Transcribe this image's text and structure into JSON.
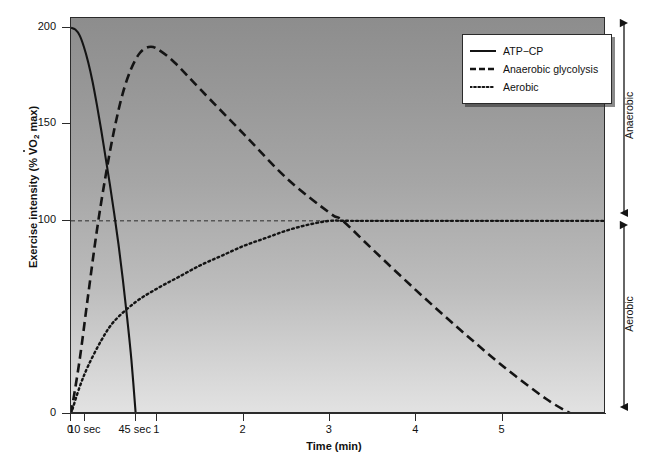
{
  "chart_data": {
    "type": "line",
    "title": "",
    "xlabel": "Time (min)",
    "ylabel": "Exercise intensity (% VO2 max)",
    "xlim": [
      0,
      6.2
    ],
    "ylim": [
      0,
      205
    ],
    "grid": false,
    "reference_line": {
      "y": 100,
      "style": "dashed",
      "label": ""
    },
    "xticks": [
      {
        "value": 0,
        "label": "0"
      },
      {
        "value": 0.1667,
        "label": "10 sec"
      },
      {
        "value": 0.75,
        "label": "45 sec"
      },
      {
        "value": 1,
        "label": "1"
      },
      {
        "value": 2,
        "label": "2"
      },
      {
        "value": 3,
        "label": "3"
      },
      {
        "value": 4,
        "label": "4"
      },
      {
        "value": 5,
        "label": "5"
      }
    ],
    "yticks": [
      {
        "value": 0,
        "label": "0"
      },
      {
        "value": 100,
        "label": "100"
      },
      {
        "value": 150,
        "label": "150"
      },
      {
        "value": 200,
        "label": "200"
      }
    ],
    "legend_position": "top-right",
    "series": [
      {
        "name": "ATP−CP",
        "style": "solid",
        "color": "#141414",
        "points": [
          [
            0.0,
            200
          ],
          [
            0.05,
            199
          ],
          [
            0.1,
            196
          ],
          [
            0.15,
            190
          ],
          [
            0.2,
            182
          ],
          [
            0.25,
            172
          ],
          [
            0.3,
            160
          ],
          [
            0.35,
            147
          ],
          [
            0.4,
            133
          ],
          [
            0.45,
            119
          ],
          [
            0.5,
            104
          ],
          [
            0.55,
            88
          ],
          [
            0.6,
            70
          ],
          [
            0.65,
            50
          ],
          [
            0.7,
            28
          ],
          [
            0.75,
            0
          ]
        ]
      },
      {
        "name": "Anaerobic glycolysis",
        "style": "dashed",
        "color": "#141414",
        "points": [
          [
            0.0,
            0
          ],
          [
            0.1,
            28
          ],
          [
            0.2,
            62
          ],
          [
            0.3,
            95
          ],
          [
            0.4,
            123
          ],
          [
            0.5,
            147
          ],
          [
            0.6,
            166
          ],
          [
            0.7,
            179
          ],
          [
            0.8,
            187
          ],
          [
            0.9,
            190
          ],
          [
            1.0,
            189
          ],
          [
            1.2,
            182
          ],
          [
            1.5,
            168
          ],
          [
            2.0,
            145
          ],
          [
            2.5,
            122
          ],
          [
            3.0,
            104
          ],
          [
            3.15,
            100
          ],
          [
            3.5,
            85
          ],
          [
            4.0,
            64
          ],
          [
            4.5,
            44
          ],
          [
            5.0,
            25
          ],
          [
            5.5,
            8
          ],
          [
            5.8,
            0
          ]
        ]
      },
      {
        "name": "Aerobic",
        "style": "dotted",
        "color": "#141414",
        "points": [
          [
            0.0,
            0
          ],
          [
            0.1,
            14
          ],
          [
            0.2,
            25
          ],
          [
            0.35,
            38
          ],
          [
            0.5,
            48
          ],
          [
            0.75,
            58
          ],
          [
            1.0,
            65
          ],
          [
            1.25,
            71
          ],
          [
            1.5,
            77
          ],
          [
            1.75,
            82
          ],
          [
            2.0,
            87
          ],
          [
            2.25,
            91
          ],
          [
            2.5,
            95
          ],
          [
            2.75,
            98
          ],
          [
            3.0,
            100
          ],
          [
            3.25,
            100
          ],
          [
            4.0,
            100
          ],
          [
            5.0,
            100
          ],
          [
            6.2,
            100
          ]
        ]
      }
    ],
    "zones": [
      {
        "name": "Anaerobic",
        "from": 100,
        "to": 205
      },
      {
        "name": "Aerobic",
        "from": 0,
        "to": 100
      }
    ]
  },
  "legend": {
    "items": [
      {
        "label": "ATP−CP",
        "style": "solid"
      },
      {
        "label": "Anaerobic glycolysis",
        "style": "dashed"
      },
      {
        "label": "Aerobic",
        "style": "dotted"
      }
    ]
  },
  "axis_titles": {
    "y_prefix": "Exercise intensity (% ",
    "y_v": "V",
    "y_sub": "2",
    "y_suffix": " max)",
    "y_o": "O",
    "x": "Time (min)"
  }
}
